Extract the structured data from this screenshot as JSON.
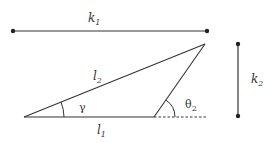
{
  "diagram": {
    "labels": {
      "k1": {
        "main": "k",
        "sub": "1"
      },
      "k2": {
        "main": "k",
        "sub": "2"
      },
      "l1": {
        "main": "l",
        "sub": "1"
      },
      "l2": {
        "main": "l",
        "sub": "2"
      },
      "gamma": {
        "main": "γ"
      },
      "theta2": {
        "main": "θ",
        "sub": "2"
      }
    },
    "colors": {
      "stroke": "#333333",
      "text": "#333333"
    }
  }
}
